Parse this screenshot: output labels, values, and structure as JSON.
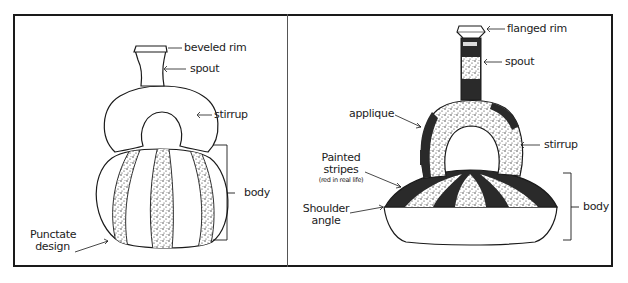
{
  "diagram": {
    "title": "",
    "panels": [
      {
        "id": "left-vessel",
        "labels": {
          "rim": "beveled rim",
          "spout": "spout",
          "stirrup": "stirrup",
          "body": "body",
          "design_line1": "Punctate",
          "design_line2": "design"
        }
      },
      {
        "id": "right-vessel",
        "labels": {
          "rim": "flanged rim",
          "spout": "spout",
          "applique": "applique",
          "stirrup": "stirrup",
          "stripes_line1": "Painted",
          "stripes_line2": "stripes",
          "stripes_note": "(red in real life)",
          "shoulder_line1": "Shoulder",
          "shoulder_line2": "angle",
          "body": "body"
        }
      }
    ],
    "colors": {
      "ink": "#1a1a1a",
      "paint": "#2a2a2a",
      "background": "#ffffff"
    }
  }
}
